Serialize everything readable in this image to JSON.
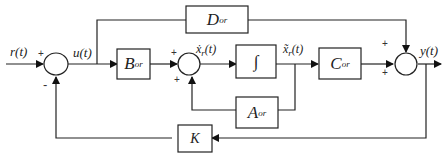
{
  "diagram": {
    "type": "state-space block diagram with state feedback",
    "signals": {
      "input": "r(t)",
      "control": "u(t)",
      "state_derivative": "ẋ_r(t)",
      "state": "x_r(t)",
      "output": "y(t)"
    },
    "blocks": {
      "B": {
        "main": "B",
        "sub": "or"
      },
      "integrator": {
        "main": "∫"
      },
      "C": {
        "main": "C",
        "sub": "or"
      },
      "D": {
        "main": "D",
        "sub": "or"
      },
      "A": {
        "main": "A",
        "sub": "or"
      },
      "K": {
        "main": "K"
      }
    },
    "signs": {
      "sum1_top": "+",
      "sum1_bottom": "-",
      "sum2_top": "+",
      "sum2_bottom": "+",
      "sum3_top": "+",
      "sum3_bottom": "+"
    },
    "labels": {
      "r": "r(t)",
      "u": "u(t)",
      "xdot_main": "ẋ",
      "xdot_sub": "r",
      "xdot_arg": "(t)",
      "x_main": "x̃",
      "x_sub": "r",
      "x_arg": "(t)",
      "y": "y(t)"
    }
  }
}
